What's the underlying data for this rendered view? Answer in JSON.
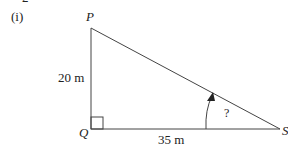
{
  "header": {
    "question_number_partial": "2",
    "part_label": "(i)"
  },
  "diagram": {
    "type": "right-triangle",
    "vertices": {
      "P": {
        "label": "P"
      },
      "Q": {
        "label": "Q"
      },
      "S": {
        "label": "S"
      }
    },
    "sides": {
      "PQ": {
        "label": "20 m"
      },
      "QS": {
        "label": "35 m"
      }
    },
    "right_angle_at": "Q",
    "unknown_angle": {
      "at": "S",
      "label": "?"
    },
    "colors": {
      "line": "#444444",
      "text": "#222222"
    }
  }
}
